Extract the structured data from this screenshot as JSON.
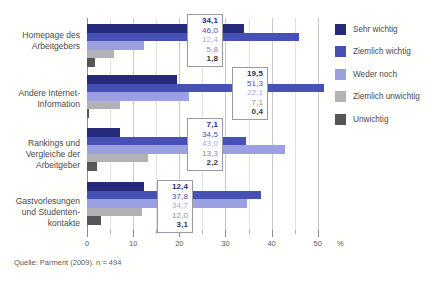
{
  "chart_data": {
    "type": "bar",
    "orientation": "horizontal",
    "title": "",
    "xlabel": "%",
    "ylabel": "",
    "xlim": [
      0,
      52
    ],
    "xticks": [
      0,
      10,
      20,
      30,
      40,
      50
    ],
    "xtick_labels": [
      "0",
      "10",
      "20",
      "30",
      "40",
      "50"
    ],
    "xminor_ticks": [
      5,
      15,
      25,
      35,
      45
    ],
    "grid": "vertical-major-and-minor",
    "legend_position": "right",
    "categories": [
      "Homepage des\nArbeitgebers",
      "Andere Internet-\nInformation",
      "Rankings und\nVergleiche der\nArbeitgeber",
      "Gastvorlesungen\nund Studenten-\nkontakte"
    ],
    "series": [
      {
        "name": "Sehr wichtig",
        "color": "#252a7a",
        "values": [
          34.1,
          19.5,
          7.1,
          12.4
        ],
        "labels": [
          "34,1",
          "19,5",
          "7,1",
          "12,4"
        ]
      },
      {
        "name": "Ziemlich wichtig",
        "color": "#4750b4",
        "values": [
          46.0,
          51.3,
          34.5,
          37.8
        ],
        "labels": [
          "46,0",
          "51,3",
          "34,5",
          "37,8"
        ]
      },
      {
        "name": "Weder noch",
        "color": "#9aa0e0",
        "values": [
          12.4,
          22.1,
          43.0,
          34.7
        ],
        "labels": [
          "12,4",
          "22,1",
          "43,0",
          "34,7"
        ]
      },
      {
        "name": "Ziemlich unwichtig",
        "color": "#b2b2b6",
        "values": [
          5.8,
          7.1,
          13.3,
          12.0
        ],
        "labels": [
          "5,8",
          "7,1",
          "13,3",
          "12,0"
        ]
      },
      {
        "name": "Unwichtig",
        "color": "#565659",
        "values": [
          1.8,
          0.4,
          2.2,
          3.1
        ],
        "labels": [
          "1,8",
          "0,4",
          "2,2",
          "3,1"
        ]
      }
    ]
  },
  "source": {
    "text": "Quelle: Parment (2009). n = 494"
  },
  "legend": {
    "items": [
      {
        "label": "Sehr wichtig"
      },
      {
        "label": "Ziemlich wichtig"
      },
      {
        "label": "Weder noch"
      },
      {
        "label": "Ziemlich unwichtig"
      },
      {
        "label": "Unwichtig"
      }
    ]
  },
  "axis": {
    "unit": "%"
  }
}
